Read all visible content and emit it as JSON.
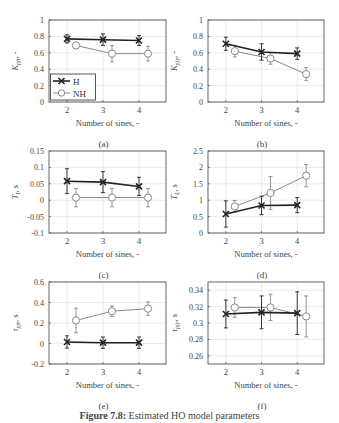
{
  "figure": {
    "caption_label": "Figure 7.8:",
    "caption_text": "Estimated HO model parameters"
  },
  "legend": {
    "entries": [
      {
        "label": "H",
        "marker": "x-cross",
        "color": "#222222"
      },
      {
        "label": "NH",
        "marker": "circle",
        "color": "#888888"
      }
    ]
  },
  "chart_data": [
    {
      "id": "a",
      "panel_label": "(a)",
      "type": "line",
      "xlabel": "Number of sines, -",
      "ylabel": "K_{pjt}, -",
      "ylabel_main": "K",
      "ylabel_sub": "pjt",
      "ylabel_unit": ", -",
      "xlim": [
        1.5,
        4.75
      ],
      "ylim": [
        0,
        1
      ],
      "xticks": [
        2,
        3,
        4
      ],
      "yticks": [
        0,
        0.2,
        0.4,
        0.6,
        0.8,
        1
      ],
      "ytick_labels": [
        "0",
        "0.2",
        "0.4",
        "0.6",
        "0.8",
        "1"
      ],
      "grid": true,
      "legend": true,
      "legend_position": "lower left",
      "series": [
        {
          "name": "H",
          "x": [
            2,
            3,
            4
          ],
          "values": [
            0.77,
            0.76,
            0.75
          ],
          "err": [
            0.05,
            0.07,
            0.06
          ]
        },
        {
          "name": "NH",
          "x": [
            2.25,
            3.25,
            4.25
          ],
          "values": [
            0.69,
            0.59,
            0.59
          ],
          "err": [
            0.03,
            0.1,
            0.09
          ]
        }
      ]
    },
    {
      "id": "b",
      "panel_label": "(b)",
      "type": "line",
      "xlabel": "Number of sines, -",
      "ylabel": "K_{pjy}, -",
      "ylabel_main": "K",
      "ylabel_sub": "pjy",
      "ylabel_unit": ", -",
      "xlim": [
        1.5,
        4.75
      ],
      "ylim": [
        0,
        1
      ],
      "xticks": [
        2,
        3,
        4
      ],
      "yticks": [
        0,
        0.2,
        0.4,
        0.6,
        0.8,
        1
      ],
      "ytick_labels": [
        "0",
        "0.2",
        "0.4",
        "0.6",
        "0.8",
        "1"
      ],
      "grid": true,
      "legend": false,
      "series": [
        {
          "name": "H",
          "x": [
            2,
            3,
            4
          ],
          "values": [
            0.71,
            0.61,
            0.59
          ],
          "err": [
            0.08,
            0.1,
            0.07
          ]
        },
        {
          "name": "NH",
          "x": [
            2.25,
            3.25,
            4.25
          ],
          "values": [
            0.62,
            0.53,
            0.34
          ],
          "err": [
            0.07,
            0.07,
            0.08
          ]
        }
      ]
    },
    {
      "id": "c",
      "panel_label": "(c)",
      "type": "line",
      "xlabel": "Number of sines, -",
      "ylabel": "T_I, s",
      "ylabel_main": "T",
      "ylabel_sub": "I",
      "ylabel_unit": ", s",
      "xlim": [
        1.5,
        4.75
      ],
      "ylim": [
        -0.1,
        0.15
      ],
      "xticks": [
        2,
        3,
        4
      ],
      "yticks": [
        -0.1,
        -0.05,
        0,
        0.05,
        0.1,
        0.15
      ],
      "ytick_labels": [
        "-0.1",
        "-0.05",
        "0",
        "0.05",
        "0.1",
        "0.15"
      ],
      "grid": true,
      "legend": false,
      "series": [
        {
          "name": "H",
          "x": [
            2,
            3,
            4
          ],
          "values": [
            0.058,
            0.055,
            0.042
          ],
          "err": [
            0.038,
            0.032,
            0.028
          ]
        },
        {
          "name": "NH",
          "x": [
            2.25,
            3.25,
            4.25
          ],
          "values": [
            0.008,
            0.008,
            0.008
          ],
          "err": [
            0.028,
            0.028,
            0.028
          ]
        }
      ]
    },
    {
      "id": "d",
      "panel_label": "(d)",
      "type": "line",
      "xlabel": "Number of sines, -",
      "ylabel": "T_L, s",
      "ylabel_main": "T",
      "ylabel_sub": "L",
      "ylabel_unit": ", s",
      "xlim": [
        1.5,
        4.75
      ],
      "ylim": [
        0,
        2.5
      ],
      "xticks": [
        2,
        3,
        4
      ],
      "yticks": [
        0,
        0.5,
        1,
        1.5,
        2,
        2.5
      ],
      "ytick_labels": [
        "0",
        "0.5",
        "1",
        "1.5",
        "2",
        "2.5"
      ],
      "grid": true,
      "legend": false,
      "series": [
        {
          "name": "H",
          "x": [
            2,
            3,
            4
          ],
          "values": [
            0.58,
            0.84,
            0.85
          ],
          "err": [
            0.4,
            0.28,
            0.23
          ]
        },
        {
          "name": "NH",
          "x": [
            2.25,
            3.25,
            4.25
          ],
          "values": [
            0.81,
            1.22,
            1.75
          ],
          "err": [
            0.18,
            0.5,
            0.34
          ]
        }
      ]
    },
    {
      "id": "e",
      "panel_label": "(e)",
      "type": "line",
      "xlabel": "Number of sines, -",
      "ylabel": "τ_{pjt}, s",
      "ylabel_main": "τ",
      "ylabel_sub": "pjt",
      "ylabel_unit": ", s",
      "xlim": [
        1.5,
        4.75
      ],
      "ylim": [
        -0.2,
        0.6
      ],
      "xticks": [
        2,
        3,
        4
      ],
      "yticks": [
        -0.2,
        0,
        0.2,
        0.4,
        0.6
      ],
      "ytick_labels": [
        "-0.2",
        "0",
        "0.2",
        "0.4",
        "0.6"
      ],
      "grid": true,
      "legend": false,
      "series": [
        {
          "name": "H",
          "x": [
            2,
            3,
            4
          ],
          "values": [
            0.015,
            0.008,
            0.008
          ],
          "err": [
            0.06,
            0.055,
            0.055
          ]
        },
        {
          "name": "NH",
          "x": [
            2.25,
            3.25,
            4.25
          ],
          "values": [
            0.225,
            0.315,
            0.34
          ],
          "err": [
            0.12,
            0.05,
            0.065
          ]
        }
      ]
    },
    {
      "id": "f",
      "panel_label": "(f)",
      "type": "line",
      "xlabel": "Number of sines, -",
      "ylabel": "τ_{pjy}, s",
      "ylabel_main": "τ",
      "ylabel_sub": "pjy",
      "ylabel_unit": ", s",
      "xlim": [
        1.5,
        4.75
      ],
      "ylim": [
        0.25,
        0.35
      ],
      "xticks": [
        2,
        3,
        4
      ],
      "yticks": [
        0.26,
        0.28,
        0.3,
        0.32,
        0.34
      ],
      "ytick_labels": [
        "0.26",
        "0.28",
        "0.3",
        "0.32",
        "0.34"
      ],
      "grid": true,
      "legend": false,
      "series": [
        {
          "name": "H",
          "x": [
            2,
            3,
            4
          ],
          "values": [
            0.311,
            0.313,
            0.312
          ],
          "err": [
            0.017,
            0.02,
            0.026
          ]
        },
        {
          "name": "NH",
          "x": [
            2.25,
            3.25,
            4.25
          ],
          "values": [
            0.319,
            0.319,
            0.308
          ],
          "err": [
            0.012,
            0.016,
            0.025
          ]
        }
      ]
    }
  ]
}
